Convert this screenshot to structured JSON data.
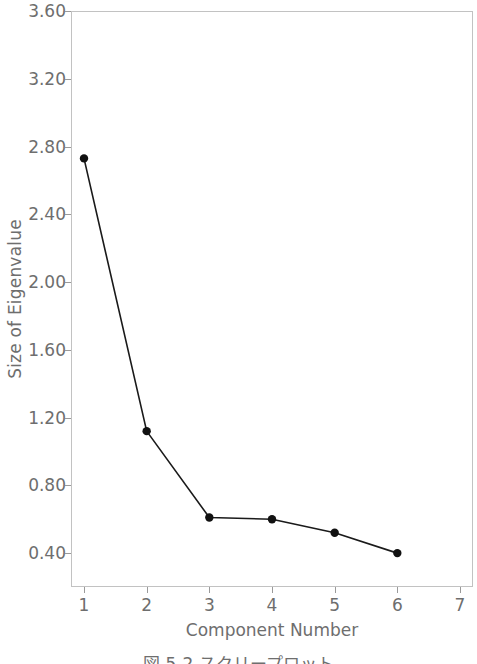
{
  "figure": {
    "caption": "図 5-2 スクリープロット"
  },
  "chart_data": {
    "type": "line",
    "title": "",
    "xlabel": "Component Number",
    "ylabel": "Size of Eigenvalue",
    "x": [
      1,
      2,
      3,
      4,
      5,
      6
    ],
    "values": [
      2.73,
      1.12,
      0.61,
      0.6,
      0.52,
      0.4
    ],
    "series": [
      {
        "name": "Eigenvalue",
        "values": [
          2.73,
          1.12,
          0.61,
          0.6,
          0.52,
          0.4
        ]
      }
    ],
    "xlim": [
      1,
      7
    ],
    "ylim": [
      0.2,
      3.6
    ],
    "x_ticks": [
      "1",
      "2",
      "3",
      "4",
      "5",
      "6",
      "7"
    ],
    "x_tick_values": [
      1,
      2,
      3,
      4,
      5,
      6,
      7
    ],
    "y_ticks": [
      "0.40",
      "0.80",
      "1.20",
      "1.60",
      "2.00",
      "2.40",
      "2.80",
      "3.20",
      "3.60"
    ],
    "y_tick_values": [
      0.4,
      0.8,
      1.2,
      1.6,
      2.0,
      2.4,
      2.8,
      3.2,
      3.6
    ],
    "grid": false,
    "legend": null,
    "marker": "filled-circle",
    "line_color": "#1a1a1a",
    "marker_color": "#111111",
    "text_color": "#6e6e6e",
    "frame_color": "#c2c2c2",
    "background_color": "#ffffff"
  }
}
